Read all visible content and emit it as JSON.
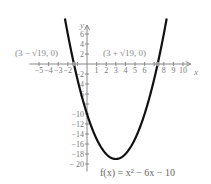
{
  "chart_data": {
    "type": "line",
    "title": "",
    "function_label": "f(x) = x² − 6x − 10",
    "xlabel": "x",
    "ylabel": "y",
    "xlim": [
      -6,
      11
    ],
    "ylim": [
      -21,
      8
    ],
    "x_ticks": [
      -5,
      -4,
      -3,
      -2,
      1,
      2,
      3,
      4,
      5,
      6,
      8,
      9,
      10
    ],
    "x_tick_labels": [
      "−5",
      "−4",
      "−3",
      "−2",
      "1",
      "2",
      "3",
      "4",
      "5",
      "6",
      "8",
      "9",
      "10"
    ],
    "y_ticks": [
      6,
      4,
      2,
      -2,
      -4,
      -6,
      -10,
      -12,
      -14,
      -16,
      -18,
      -20
    ],
    "y_tick_labels": [
      "6",
      "4",
      "2",
      "−2",
      "4",
      "6",
      "−10",
      "−12",
      "−14",
      "−16",
      "−18",
      "− 20"
    ],
    "grid": false,
    "series": [
      {
        "name": "f(x) = x^2 - 6x - 10",
        "x": [
          -2,
          -1.36,
          -1,
          0,
          1,
          2,
          3,
          4,
          5,
          6,
          7,
          7.36,
          8
        ],
        "y": [
          6,
          0,
          -3,
          -10,
          -15,
          -18,
          -19,
          -18,
          -15,
          -10,
          -3,
          0,
          6
        ]
      }
    ],
    "annotations": [
      {
        "text": "(3 − √19, 0)",
        "x": -1.36,
        "y": 0
      },
      {
        "text": "(3 + √19, 0)",
        "x": 7.36,
        "y": 0
      }
    ],
    "vertex": {
      "x": 3,
      "y": -19
    }
  },
  "labels": {
    "x_axis": "x",
    "y_axis": "y",
    "left_root": "(3 − √19, 0)",
    "right_root": "(3 + √19, 0)",
    "equation": "f(x) = x² − 6x − 10"
  }
}
